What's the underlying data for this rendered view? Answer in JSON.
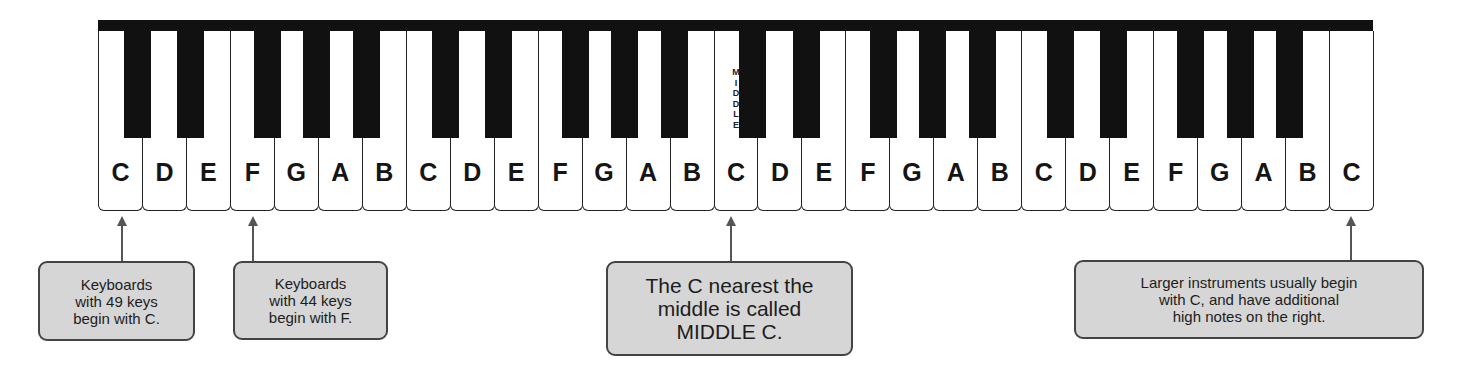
{
  "diagram": {
    "type": "piano-keyboard",
    "white_key_count": 29,
    "white_keys": [
      "C",
      "D",
      "E",
      "F",
      "G",
      "A",
      "B",
      "C",
      "D",
      "E",
      "F",
      "G",
      "A",
      "B",
      "C",
      "D",
      "E",
      "F",
      "G",
      "A",
      "B",
      "C",
      "D",
      "E",
      "F",
      "G",
      "A",
      "B",
      "C"
    ],
    "middle_c_index": 14,
    "middle_label": "M\nI\nD\nD\nL\nE",
    "colors": {
      "black_key": "#111111",
      "white_key": "#ffffff",
      "callout_fill": "#d6d6d6",
      "callout_border": "#444444"
    }
  },
  "callouts": [
    {
      "id": "c49",
      "text": "Keyboards\nwith 49 keys\nbegin with C.",
      "points_to_key_index": 0
    },
    {
      "id": "f44",
      "text": "Keyboards\nwith 44 keys\nbegin with F.",
      "points_to_key_index": 3
    },
    {
      "id": "middle",
      "text": "The C nearest the\nmiddle is called\nMIDDLE C.",
      "points_to_key_index": 14
    },
    {
      "id": "larger",
      "text": "Larger instruments usually begin\nwith C, and have additional\nhigh notes on the right.",
      "points_to_key_index": 28
    }
  ]
}
